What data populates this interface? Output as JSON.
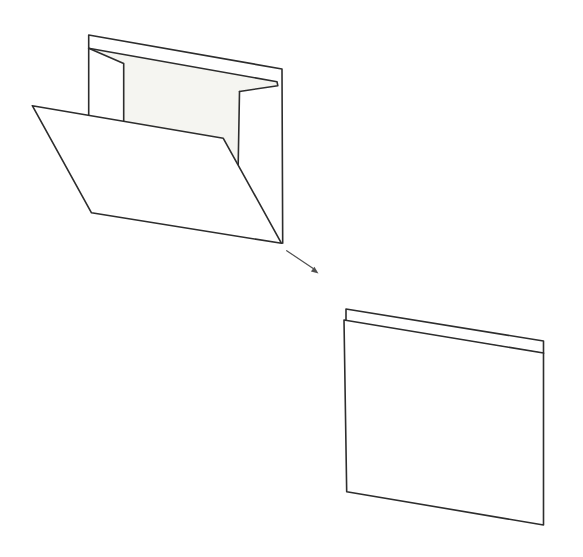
{
  "canvas": {
    "width": "583",
    "height": "557",
    "viewbox": "0 0 583 557"
  },
  "colors": {
    "outline": "#2d2d2d",
    "paper_fill": "#ffffff",
    "interior_shade": "#f5f5f1",
    "arrow": "#4f4f4f",
    "background": "#ffffff"
  },
  "diagram": {
    "type": "paper-folding-step",
    "open_sheet": {
      "interior_shade_points": "88.7,48.3 277,81.7 277.8,85.7 239.5,91.5 238.2,164.8 223.3,138.3 123.7,121.2 123.7,63.5",
      "back_wall_points": "88.7,115.2 88.7,35 282,69 282.7,243.3",
      "top_thickness_points": "88.7,48.3 277,81.7 277.8,85.7 239.5,91.5",
      "left_flap_points": "88.7,48.3 123.7,63.5 123.7,121.2",
      "right_flap_points": "239.5,91.5 238.2,164.8",
      "front_flap_points": "32.3,105.7 223.3,138.3 281.5,243.3 91.5,212.8"
    },
    "fold_arrow": {
      "shaft_points": "286.7,250.7 313.2,268.6",
      "head_points": "318.5,273.5 310.9,271.6 314.4,266.7"
    },
    "folded_result": {
      "back_strip_points": "346,309 543.5,341 543.5,353.5 346,321.5",
      "front_panel_points": "344,320 543.5,353 543.5,525 346.7,491.7"
    }
  }
}
